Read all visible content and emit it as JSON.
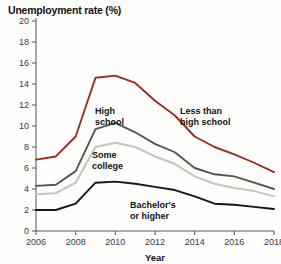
{
  "chart_data": {
    "type": "line",
    "title": "Unemployment rate (%)",
    "xlabel": "Year",
    "ylabel": "",
    "xlim": [
      2006,
      2018
    ],
    "ylim": [
      0,
      20
    ],
    "grid": false,
    "legend_position": "inline-annotations",
    "x": [
      2006,
      2007,
      2008,
      2009,
      2010,
      2011,
      2012,
      2013,
      2014,
      2015,
      2016,
      2017,
      2018
    ],
    "xticks": [
      "2006",
      "2008",
      "2010",
      "2012",
      "2014",
      "2016",
      "2018"
    ],
    "yticks": [
      "0",
      "2",
      "4",
      "6",
      "8",
      "10",
      "12",
      "14",
      "16",
      "18",
      "20"
    ],
    "series": [
      {
        "name": "Less than high school",
        "color": "#9c2b22",
        "values": [
          6.8,
          7.1,
          9.0,
          14.6,
          14.8,
          14.1,
          12.4,
          11.0,
          9.0,
          8.0,
          7.3,
          6.5,
          5.6
        ]
      },
      {
        "name": "High school",
        "color": "#4d5a4b",
        "values": [
          4.3,
          4.4,
          5.7,
          9.7,
          10.3,
          9.4,
          8.3,
          7.5,
          6.0,
          5.4,
          5.2,
          4.6,
          4.0
        ]
      },
      {
        "name": "Some college",
        "color": "#c3c6bd",
        "values": [
          3.5,
          3.6,
          4.6,
          8.0,
          8.4,
          8.0,
          7.1,
          6.4,
          5.2,
          4.5,
          4.1,
          3.8,
          3.3
        ]
      },
      {
        "name": "Bachelor's or higher",
        "color": "#1b1410",
        "values": [
          2.0,
          2.0,
          2.6,
          4.6,
          4.7,
          4.5,
          4.2,
          3.9,
          3.3,
          2.6,
          2.5,
          2.3,
          2.1
        ]
      }
    ],
    "annotations": [
      {
        "text_line1": "High",
        "text_line2": "school",
        "series": "High school"
      },
      {
        "text_line1": "Less than",
        "text_line2": "high school",
        "series": "Less than high school"
      },
      {
        "text_line1": "Some",
        "text_line2": "college",
        "series": "Some college"
      },
      {
        "text_line1": "Bachelor's",
        "text_line2": "or higher",
        "series": "Bachelor's or higher"
      }
    ]
  }
}
